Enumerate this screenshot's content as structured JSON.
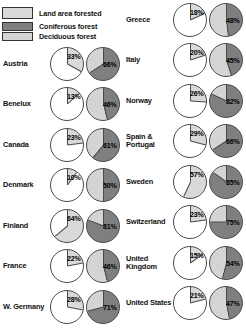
{
  "legend": {
    "items": [
      {
        "label": "Land area forested",
        "swatch": "total-forest-swatch"
      },
      {
        "label": "Coniferous forest",
        "swatch": "coniferous-swatch"
      },
      {
        "label": "Deciduous forest",
        "swatch": "deciduous-swatch"
      }
    ]
  },
  "colors": {
    "land_area_forested": "#d9d9d9",
    "coniferous": "#7f7f7f",
    "deciduous": "#d4d4d4",
    "unforested": "#ffffff",
    "outline": "#4a4a4a",
    "text": "#111111",
    "background": "#ffffff"
  },
  "chart_data": {
    "type": "pie",
    "title": "",
    "legend": [
      "Land area forested",
      "Coniferous forest",
      "Deciduous forest"
    ],
    "legend_position": "top-left",
    "units": "percent",
    "series": [
      {
        "name": "Land area forested",
        "pie_index": 0,
        "label_suffix": "%"
      },
      {
        "name": "Coniferous forest",
        "pie_index": 1,
        "label_suffix": "%"
      }
    ],
    "columns": [
      {
        "name": "left-column",
        "rows": [
          {
            "country": "Austria",
            "land_area_forested": 33,
            "land_area_forested_label": "33%",
            "coniferous": 66,
            "coniferous_label": "66%",
            "deciduous": 34
          },
          {
            "country": "Benelux",
            "land_area_forested": 13,
            "land_area_forested_label": "13%",
            "coniferous": 46,
            "coniferous_label": "46%",
            "deciduous": 54
          },
          {
            "country": "Canada",
            "land_area_forested": 23,
            "land_area_forested_label": "23%",
            "coniferous": 61,
            "coniferous_label": "61%",
            "deciduous": 39
          },
          {
            "country": "Denmark",
            "land_area_forested": 10,
            "land_area_forested_label": "10%",
            "coniferous": 50,
            "coniferous_label": "50%",
            "deciduous": 50
          },
          {
            "country": "Finland",
            "land_area_forested": 64,
            "land_area_forested_label": "64%",
            "coniferous": 81,
            "coniferous_label": "81%",
            "deciduous": 19
          },
          {
            "country": "France",
            "land_area_forested": 22,
            "land_area_forested_label": "22%",
            "coniferous": 46,
            "coniferous_label": "46%",
            "deciduous": 54
          },
          {
            "country": "W. Germany",
            "land_area_forested": 28,
            "land_area_forested_label": "28%",
            "coniferous": 71,
            "coniferous_label": "71%",
            "deciduous": 29
          }
        ]
      },
      {
        "name": "right-column",
        "rows": [
          {
            "country": "Greece",
            "land_area_forested": 18,
            "land_area_forested_label": "18%",
            "coniferous": 48,
            "coniferous_label": "48%",
            "deciduous": 52
          },
          {
            "country": "Italy",
            "land_area_forested": 20,
            "land_area_forested_label": "20%",
            "coniferous": 45,
            "coniferous_label": "45%",
            "deciduous": 55
          },
          {
            "country": "Norway",
            "land_area_forested": 26,
            "land_area_forested_label": "26%",
            "coniferous": 82,
            "coniferous_label": "82%",
            "deciduous": 18
          },
          {
            "country": "Spain & Portugal",
            "land_area_forested": 29,
            "land_area_forested_label": "29%",
            "coniferous": 66,
            "coniferous_label": "66%",
            "deciduous": 34
          },
          {
            "country": "Sweden",
            "land_area_forested": 57,
            "land_area_forested_label": "57%",
            "coniferous": 85,
            "coniferous_label": "85%",
            "deciduous": 15
          },
          {
            "country": "Switzerland",
            "land_area_forested": 23,
            "land_area_forested_label": "23%",
            "coniferous": 75,
            "coniferous_label": "75%",
            "deciduous": 25
          },
          {
            "country": "United Kingdom",
            "land_area_forested": 15,
            "land_area_forested_label": "15%",
            "coniferous": 54,
            "coniferous_label": "54%",
            "deciduous": 46
          },
          {
            "country": "United States",
            "land_area_forested": 21,
            "land_area_forested_label": "21%",
            "coniferous": 47,
            "coniferous_label": "47%",
            "deciduous": 53
          }
        ]
      }
    ]
  }
}
